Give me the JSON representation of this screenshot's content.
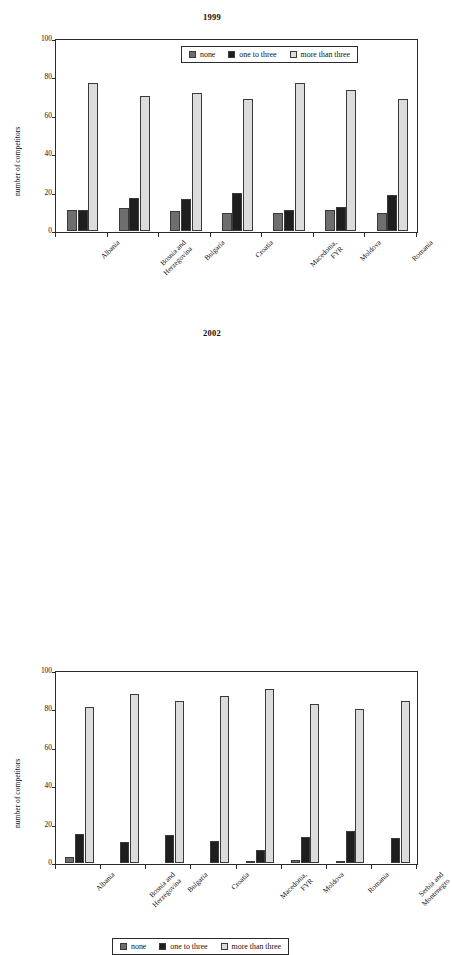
{
  "page": {
    "background": "#ffffff",
    "width": 424,
    "height": 640
  },
  "colors": {
    "none": "#6e6e6e",
    "one_to_three": "#1e1e1e",
    "more_than_three": "#dcdcdc",
    "axis": "#2a2a2a",
    "text": "#111111"
  },
  "legend": {
    "position": "inside-top-right (1999) / below-plot-center (2002)",
    "entries": [
      {
        "label": "none",
        "key": "none"
      },
      {
        "label": "one to three",
        "key": "one_to_three"
      },
      {
        "label": "more than three",
        "key": "more_than_three"
      }
    ]
  },
  "axis": {
    "ylabel": "number of competitors",
    "yticks": [
      "0",
      "20",
      "40",
      "60",
      "80",
      "100"
    ],
    "ylim": [
      0,
      100
    ]
  },
  "chart_data": [
    {
      "type": "bar",
      "title": "1999",
      "xlabel": "",
      "ylabel": "number of competitors",
      "ylim": [
        0,
        100
      ],
      "yticks": [
        0,
        20,
        40,
        60,
        80,
        100
      ],
      "grid": false,
      "legend_position": "top-right-inside",
      "categories": [
        "Albania",
        "Bosnia and Herzegovina",
        "Bulgaria",
        "Croatia",
        "Macedonia, FYR",
        "Moldova",
        "Romania"
      ],
      "series": [
        {
          "name": "none",
          "values": [
            11,
            12,
            10.5,
            9.5,
            9.5,
            11,
            9.5
          ]
        },
        {
          "name": "one to three",
          "values": [
            11,
            17,
            16.5,
            20,
            11,
            12.5,
            19
          ]
        },
        {
          "name": "more than three",
          "values": [
            77,
            70.5,
            72,
            69,
            77,
            73.5,
            68.5
          ]
        }
      ]
    },
    {
      "type": "bar",
      "title": "2002",
      "xlabel": "",
      "ylabel": "number of competitors",
      "ylim": [
        0,
        100
      ],
      "yticks": [
        0,
        20,
        40,
        60,
        80,
        100
      ],
      "grid": false,
      "legend_position": "bottom-center-outside",
      "categories": [
        "Albania",
        "Bosnia and Herzegovina",
        "Bulgaria",
        "Croatia",
        "Macedonia, FYR",
        "Moldova",
        "Romania",
        "Serbia and Montenegro"
      ],
      "series": [
        {
          "name": "none",
          "values": [
            3,
            0,
            0,
            0,
            1,
            1.5,
            0.5,
            0
          ]
        },
        {
          "name": "one to three",
          "values": [
            15,
            11,
            14.5,
            11.5,
            7,
            13.5,
            16.5,
            13
          ]
        },
        {
          "name": "more than three",
          "values": [
            81,
            88,
            84.5,
            87,
            90.5,
            83,
            80,
            84.5
          ]
        }
      ]
    }
  ],
  "category_label_lines": {
    "Albania": [
      "Albania"
    ],
    "Bosnia and Herzegovina": [
      "Bosnia and",
      "Herzegovina"
    ],
    "Bulgaria": [
      "Bulgaria"
    ],
    "Croatia": [
      "Croatia"
    ],
    "Macedonia, FYR": [
      "Macedonia,",
      "FYR"
    ],
    "Moldova": [
      "Moldova"
    ],
    "Romania": [
      "Romania"
    ],
    "Serbia and Montenegro": [
      "Serbia and",
      "Montenegro"
    ]
  }
}
